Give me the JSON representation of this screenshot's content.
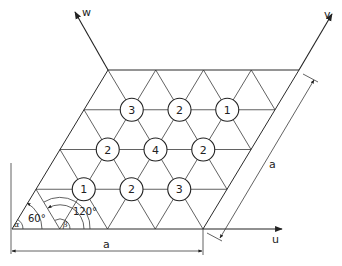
{
  "diagram": {
    "axes": {
      "u_label": "u",
      "v_label": "v",
      "w_label": "w"
    },
    "dimension_labels": {
      "bottom_side": "a",
      "right_side": "a"
    },
    "angles": {
      "alpha_symbol": "α",
      "alpha_value": "60°",
      "beta_symbol": "β",
      "beta_value": "120°"
    },
    "lattice": {
      "cells_per_side": 4,
      "angle_deg": 60
    },
    "site_labels": [
      {
        "row": 1,
        "col": 1,
        "value": "1"
      },
      {
        "row": 1,
        "col": 2,
        "value": "2"
      },
      {
        "row": 1,
        "col": 3,
        "value": "3"
      },
      {
        "row": 2,
        "col": 1,
        "value": "2"
      },
      {
        "row": 2,
        "col": 2,
        "value": "4"
      },
      {
        "row": 2,
        "col": 3,
        "value": "2"
      },
      {
        "row": 3,
        "col": 1,
        "value": "3"
      },
      {
        "row": 3,
        "col": 2,
        "value": "2"
      },
      {
        "row": 3,
        "col": 3,
        "value": "1"
      }
    ]
  }
}
